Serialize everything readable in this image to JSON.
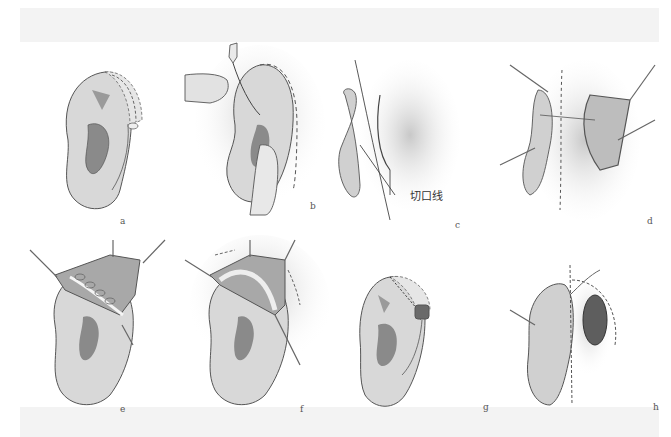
{
  "figure": {
    "panels": [
      {
        "id": "a",
        "label": "a"
      },
      {
        "id": "b",
        "label": "b"
      },
      {
        "id": "c",
        "label": "c",
        "annotation": "切口线"
      },
      {
        "id": "d",
        "label": "d"
      },
      {
        "id": "e",
        "label": "e"
      },
      {
        "id": "f",
        "label": "f"
      },
      {
        "id": "g",
        "label": "g"
      },
      {
        "id": "h",
        "label": "h"
      }
    ]
  },
  "colors": {
    "skin": "#dcdcdc",
    "skin_dark": "#9a9a9a",
    "concha": "#8a8a8a",
    "outline": "#444444",
    "shadow": "#cfcfcf",
    "band": "#f3f3f3"
  }
}
